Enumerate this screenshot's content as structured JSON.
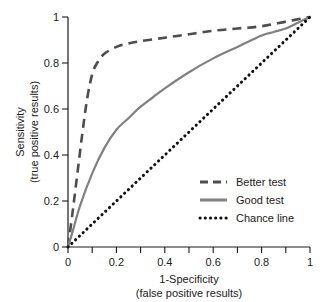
{
  "chart_data": {
    "type": "line",
    "title": "",
    "xlabel": "1-Specificity",
    "xlabel_sub": "(false positive results)",
    "ylabel": "Sensitivity",
    "ylabel_sub": "(true positive results)",
    "xlim": [
      0,
      1
    ],
    "ylim": [
      0,
      1
    ],
    "grid": false,
    "xticks": [
      0,
      0.2,
      0.4,
      0.6,
      0.8,
      1
    ],
    "xtick_labels": [
      "0",
      "0.2",
      "0.4",
      "0.6",
      "0.8",
      "1"
    ],
    "xminor_ticks": [
      0.1,
      0.3,
      0.5,
      0.7,
      0.9
    ],
    "yticks": [
      0,
      0.2,
      0.4,
      0.6,
      0.8,
      1
    ],
    "ytick_labels": [
      "0",
      "0.2",
      "0.4",
      "0.6",
      "0.8",
      "1"
    ],
    "legend_position": "lower-right",
    "series": [
      {
        "name": "Better test",
        "style": "dashed",
        "color": "#4d4d4d",
        "x": [
          0,
          0.02,
          0.04,
          0.06,
          0.08,
          0.1,
          0.12,
          0.15,
          0.2,
          0.25,
          0.3,
          0.4,
          0.5,
          0.6,
          0.7,
          0.8,
          0.9,
          1
        ],
        "y": [
          0,
          0.16,
          0.33,
          0.5,
          0.65,
          0.75,
          0.8,
          0.84,
          0.87,
          0.885,
          0.895,
          0.91,
          0.925,
          0.94,
          0.95,
          0.96,
          0.98,
          1
        ]
      },
      {
        "name": "Good test",
        "style": "solid",
        "color": "#808080",
        "x": [
          0,
          0.02,
          0.05,
          0.1,
          0.15,
          0.2,
          0.25,
          0.3,
          0.35,
          0.4,
          0.5,
          0.6,
          0.7,
          0.8,
          0.85,
          0.9,
          0.95,
          1
        ],
        "y": [
          0,
          0.07,
          0.18,
          0.32,
          0.43,
          0.51,
          0.56,
          0.61,
          0.65,
          0.69,
          0.76,
          0.82,
          0.87,
          0.92,
          0.935,
          0.95,
          0.975,
          1
        ]
      },
      {
        "name": "Chance line",
        "style": "dotted",
        "color": "#111111",
        "x": [
          0,
          1
        ],
        "y": [
          0,
          1
        ]
      }
    ]
  },
  "legend": {
    "items": [
      {
        "label": "Better test",
        "marker": "dashed-line-swatch"
      },
      {
        "label": "Good test",
        "marker": "solid-line-swatch"
      },
      {
        "label": "Chance line",
        "marker": "dotted-line-swatch"
      }
    ]
  },
  "colors": {
    "better_test": "#4d4d4d",
    "good_test": "#808080",
    "chance_line": "#111111",
    "axis": "#1a1a1a",
    "background": "#ffffff"
  }
}
